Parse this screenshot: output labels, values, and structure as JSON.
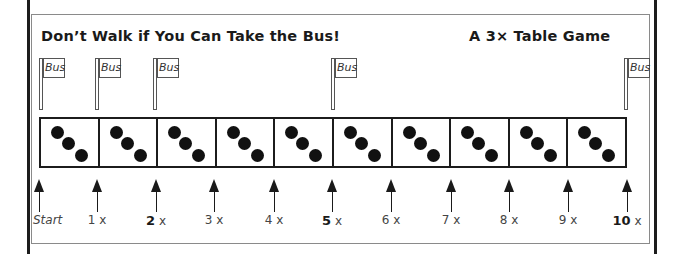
{
  "title": "Don’t Walk if You Can Take the Bus!",
  "subtitle": "A 3× Table Game",
  "flags": [
    {
      "label": "Bus",
      "x": 39
    },
    {
      "label": "Bus",
      "x": 95
    },
    {
      "label": "Bus",
      "x": 153
    },
    {
      "label": "Bus",
      "x": 331
    },
    {
      "label": "Bus",
      "x": 624
    }
  ],
  "board": {
    "cells": 10,
    "dots_per_cell": 3
  },
  "markers": [
    {
      "num": "",
      "suffix": "Start",
      "bold": false,
      "x": 39
    },
    {
      "num": "1",
      "suffix": " x",
      "bold": false,
      "x": 97
    },
    {
      "num": "2",
      "suffix": " x",
      "bold": true,
      "x": 156
    },
    {
      "num": "3",
      "suffix": " x",
      "bold": false,
      "x": 214
    },
    {
      "num": "4",
      "suffix": " x",
      "bold": false,
      "x": 274
    },
    {
      "num": "5",
      "suffix": " x",
      "bold": true,
      "x": 332
    },
    {
      "num": "6",
      "suffix": " x",
      "bold": false,
      "x": 391
    },
    {
      "num": "7",
      "suffix": " x",
      "bold": false,
      "x": 451
    },
    {
      "num": "8",
      "suffix": " x",
      "bold": false,
      "x": 509
    },
    {
      "num": "9",
      "suffix": " x",
      "bold": false,
      "x": 568
    },
    {
      "num": "10",
      "suffix": " x",
      "bold": true,
      "x": 627
    }
  ]
}
